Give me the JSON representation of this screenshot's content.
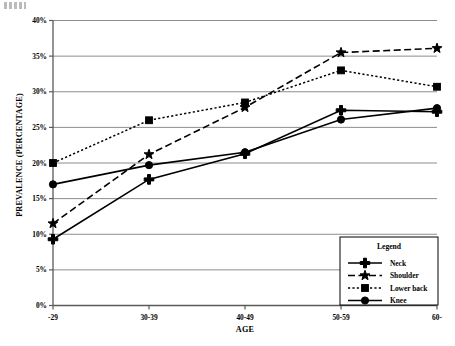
{
  "chart_data": {
    "type": "line",
    "title": "",
    "xlabel": "AGE",
    "ylabel": "PREVALENCE (PERCENTAGE)",
    "categories": [
      "-29",
      "30-39",
      "40-49",
      "50-59",
      "60-"
    ],
    "ylim": [
      0,
      40
    ],
    "ytick_labels": [
      "0%",
      "5%",
      "10%",
      "15%",
      "20%",
      "25%",
      "30%",
      "35%",
      "40%"
    ],
    "ytick_values": [
      0,
      5,
      10,
      15,
      20,
      25,
      30,
      35,
      40
    ],
    "grid": "horizontal",
    "legend_position": "bottom-right",
    "legend_title": "Legend",
    "series": [
      {
        "name": "Neck",
        "marker": "plus",
        "linestyle": "solid",
        "color": "#000000",
        "values": [
          9.3,
          17.7,
          21.3,
          27.4,
          27.2
        ]
      },
      {
        "name": "Shoulder",
        "marker": "star",
        "linestyle": "dashed",
        "color": "#000000",
        "values": [
          11.5,
          21.2,
          27.8,
          35.5,
          36.1
        ]
      },
      {
        "name": "Lower back",
        "marker": "square",
        "linestyle": "dotted",
        "color": "#000000",
        "values": [
          20.0,
          26.0,
          28.5,
          33.0,
          30.7
        ]
      },
      {
        "name": "Knee",
        "marker": "circle",
        "linestyle": "solid",
        "color": "#000000",
        "values": [
          17.0,
          19.7,
          21.5,
          26.1,
          27.7
        ]
      }
    ]
  },
  "legend": {
    "title": "Legend",
    "entries": [
      {
        "label": "Neck"
      },
      {
        "label": "Shoulder"
      },
      {
        "label": "Lower back"
      },
      {
        "label": "Knee"
      }
    ]
  }
}
